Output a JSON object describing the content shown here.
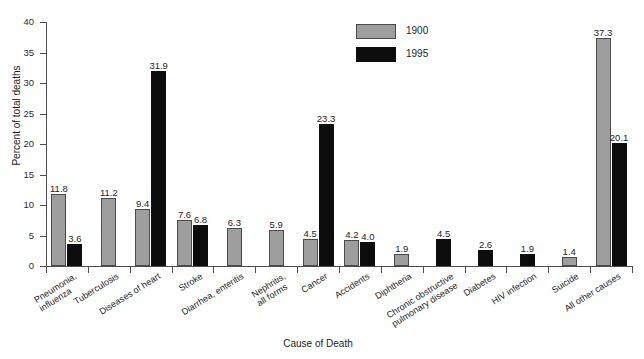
{
  "chart_data": {
    "type": "bar",
    "title": "",
    "xlabel": "Cause of Death",
    "ylabel": "Percent of total deaths",
    "ylim": [
      0,
      40
    ],
    "yticks": [
      0,
      5,
      10,
      15,
      20,
      25,
      30,
      35,
      40
    ],
    "grid": false,
    "legend_position": "top-right",
    "categories": [
      "Pneumonia,\ninfluenza",
      "Tuberculosis",
      "Diseases of heart",
      "Stroke",
      "Diarrhea, enteritis",
      "Nephritis,\nall forms",
      "Cancer",
      "Accidents",
      "Diphtheria",
      "Chronic obstructive\npulmonary disease",
      "Diabetes",
      "HIV infection",
      "Suicide",
      "All other causes"
    ],
    "category_lines": [
      [
        "Pneumonia,",
        "influenza"
      ],
      [
        "Tuberculosis"
      ],
      [
        "Diseases of heart"
      ],
      [
        "Stroke"
      ],
      [
        "Diarrhea, enteritis"
      ],
      [
        "Nephritis,",
        "all forms"
      ],
      [
        "Cancer"
      ],
      [
        "Accidents"
      ],
      [
        "Diphtheria"
      ],
      [
        "Chronic obstructive",
        "pulmonary disease"
      ],
      [
        "Diabetes"
      ],
      [
        "HIV infection"
      ],
      [
        "Suicide"
      ],
      [
        "All other causes"
      ]
    ],
    "series": [
      {
        "name": "1900",
        "color": "#9e9e9e",
        "values": [
          11.8,
          11.2,
          9.4,
          7.6,
          6.3,
          5.9,
          4.5,
          4.2,
          1.9,
          null,
          null,
          null,
          1.4,
          37.3
        ],
        "labels": [
          "11.8",
          "11.2",
          "9.4",
          "7.6",
          "6.3",
          "5.9",
          "4.5",
          "4.2",
          "1.9",
          "",
          "",
          "",
          "1.4",
          "37.3"
        ]
      },
      {
        "name": "1995",
        "color": "#0d0d0d",
        "values": [
          3.6,
          null,
          31.9,
          6.8,
          null,
          null,
          23.3,
          4.0,
          null,
          4.5,
          2.6,
          1.9,
          null,
          20.1
        ],
        "labels": [
          "3.6",
          "",
          "31.9",
          "6.8",
          "",
          "",
          "23.3",
          "4.0",
          "",
          "4.5",
          "2.6",
          "1.9",
          "",
          "20.1"
        ]
      }
    ]
  },
  "legend": {
    "items": [
      {
        "label": "1900",
        "color": "#9e9e9e"
      },
      {
        "label": "1995",
        "color": "#0d0d0d"
      }
    ]
  },
  "axes": {
    "y_title": "Percent of total deaths",
    "x_title": "Cause of Death",
    "y_tick_labels": [
      "0",
      "5",
      "10",
      "15",
      "20",
      "25",
      "30",
      "35",
      "40"
    ]
  }
}
